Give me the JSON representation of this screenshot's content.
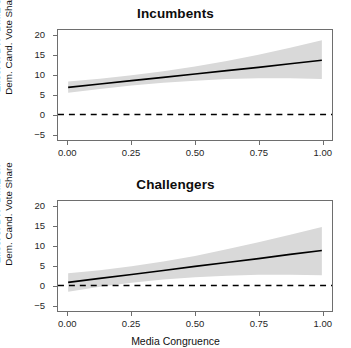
{
  "figure": {
    "width": 351,
    "height": 342,
    "background": "#ffffff",
    "band_color": "#d9d9d9",
    "line_color": "#000000",
    "axis_color": "#6e6e6e"
  },
  "axis_titles": {
    "y_line1": "Effect of DW−DIME on",
    "y_line2": "Dem. Cand. Vote Share",
    "x": "Media Congruence"
  },
  "chart_data": [
    {
      "type": "line",
      "title": "Incumbents",
      "xlabel": "",
      "ylabel": "Effect of DW−DIME on Dem. Cand. Vote Share",
      "xlim": [
        -0.04,
        1.04
      ],
      "ylim": [
        -6.5,
        21.5
      ],
      "xticks": [
        0,
        0.25,
        0.5,
        0.75,
        1
      ],
      "xticklabels": [
        "0.00",
        "0.25",
        "0.50",
        "0.75",
        "1.00"
      ],
      "yticks": [
        -5,
        0,
        5,
        10,
        15,
        20
      ],
      "yticklabels": [
        "−5",
        "0",
        "5",
        "10",
        "15",
        "20"
      ],
      "grid": false,
      "legend": "none",
      "reference_line": {
        "y": 0,
        "style": "dashed",
        "color": "#000000"
      },
      "x": [
        0.0,
        0.125,
        0.25,
        0.375,
        0.5,
        0.625,
        0.75,
        0.875,
        1.0
      ],
      "series": [
        {
          "name": "Marginal effect",
          "values": [
            6.9,
            7.75,
            8.6,
            9.45,
            10.3,
            11.15,
            12.0,
            12.9,
            13.8
          ]
        },
        {
          "name": "95% CI lower",
          "values": [
            5.5,
            6.5,
            7.4,
            8.1,
            8.6,
            9.0,
            9.2,
            9.2,
            9.0
          ]
        },
        {
          "name": "95% CI upper",
          "values": [
            8.4,
            9.1,
            10.0,
            11.0,
            12.2,
            13.6,
            15.2,
            17.0,
            18.9
          ]
        }
      ]
    },
    {
      "type": "line",
      "title": "Challengers",
      "xlabel": "Media Congruence",
      "ylabel": "Effect of DW−DIME on Dem. Cand. Vote Share",
      "xlim": [
        -0.04,
        1.04
      ],
      "ylim": [
        -6.5,
        21.5
      ],
      "xticks": [
        0,
        0.25,
        0.5,
        0.75,
        1
      ],
      "xticklabels": [
        "0.00",
        "0.25",
        "0.50",
        "0.75",
        "1.00"
      ],
      "yticks": [
        -5,
        0,
        5,
        10,
        15,
        20
      ],
      "yticklabels": [
        "−5",
        "0",
        "5",
        "10",
        "15",
        "20"
      ],
      "grid": false,
      "legend": "none",
      "reference_line": {
        "y": 0,
        "style": "dashed",
        "color": "#000000"
      },
      "x": [
        0.0,
        0.125,
        0.25,
        0.375,
        0.5,
        0.625,
        0.75,
        0.875,
        1.0
      ],
      "series": [
        {
          "name": "Marginal effect",
          "values": [
            0.8,
            1.8,
            2.8,
            3.8,
            4.85,
            5.85,
            6.85,
            7.9,
            8.9
          ]
        },
        {
          "name": "95% CI lower",
          "values": [
            -1.6,
            -0.3,
            0.7,
            1.5,
            2.1,
            2.5,
            2.7,
            2.7,
            2.6
          ]
        },
        {
          "name": "95% CI upper",
          "values": [
            3.1,
            3.9,
            4.9,
            6.1,
            7.5,
            9.2,
            11.0,
            12.9,
            14.9
          ]
        }
      ]
    }
  ]
}
